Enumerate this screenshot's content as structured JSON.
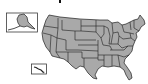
{
  "map": {
    "subject": "United States map with state boundaries",
    "fill_color": "#a9a9a9",
    "stroke_color": "#1e1e1e",
    "background": "#ffffff",
    "insets": [
      {
        "name": "Alaska",
        "position": "top-left"
      },
      {
        "name": "Hawaii",
        "position": "bottom-left"
      }
    ]
  }
}
